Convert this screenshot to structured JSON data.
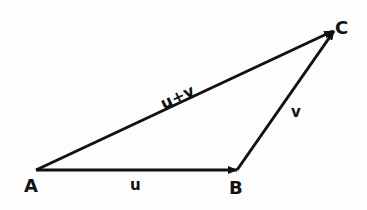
{
  "diagram": {
    "colors": {
      "stroke": "#111111",
      "background": "#fdfdfd"
    },
    "points": {
      "A": {
        "label": "A",
        "x": 36,
        "y": 170
      },
      "B": {
        "label": "B",
        "x": 237,
        "y": 170
      },
      "C": {
        "label": "C",
        "x": 335,
        "y": 30
      }
    },
    "vectors": [
      {
        "name": "u",
        "label": "u",
        "from": "A",
        "to": "B"
      },
      {
        "name": "v",
        "label": "v",
        "from": "B",
        "to": "C"
      },
      {
        "name": "u_plus_v",
        "label": "u+v",
        "from": "A",
        "to": "C"
      }
    ]
  }
}
